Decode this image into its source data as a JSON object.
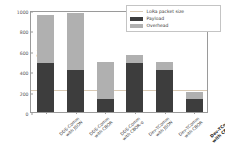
{
  "chart_data": {
    "type": "bar",
    "subtype": "stacked-bar",
    "title": "",
    "xlabel": "",
    "ylabel": "Bytes",
    "ylim": [
      0,
      1000
    ],
    "yticks": [
      0,
      200,
      400,
      600,
      800,
      1000
    ],
    "grid": false,
    "legend_position": "upper right",
    "categories": [
      "DDS-Comm with JSON",
      "DDS-Comm with CBOR",
      "DDS-Comm with CBOR-o",
      "Dev-TComm with JSON",
      "Dev-TComm with CBOR",
      "Dev-TComm with CBOR-o"
    ],
    "category_lines": [
      [
        "DDS-Comm",
        "with JSON"
      ],
      [
        "DDS-Comm",
        "with CBOR"
      ],
      [
        "DDS-Comm",
        "with CBOR-o"
      ],
      [
        "Dev-TComm",
        "with JSON"
      ],
      [
        "Dev-TComm",
        "with CBOR"
      ],
      [
        "Dev-TComm",
        "with CBOR-o"
      ]
    ],
    "highlighted_category_index": 5,
    "series": [
      {
        "name": "Payload",
        "color": "#3d3d3d",
        "values": [
          485,
          410,
          125,
          485,
          410,
          130
        ]
      },
      {
        "name": "Overhead",
        "color": "#b0b0b0",
        "values": [
          470,
          565,
          365,
          75,
          80,
          70
        ]
      }
    ],
    "totals": [
      955,
      975,
      490,
      560,
      490,
      200
    ],
    "reference_line": {
      "name": "LoRa packet size",
      "value": 240,
      "color": "#d8c9b4"
    },
    "legend": [
      {
        "label": "LoRa packet size",
        "marker": "line",
        "color": "#d8c9b4"
      },
      {
        "label": "Payload",
        "marker": "swatch",
        "color": "#3d3d3d"
      },
      {
        "label": "Overhead",
        "marker": "swatch",
        "color": "#b0b0b0"
      }
    ]
  }
}
